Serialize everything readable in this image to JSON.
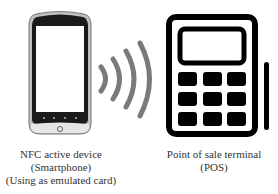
{
  "diagram": {
    "nodes": [
      {
        "id": "phone",
        "type": "smartphone",
        "icon": "smartphone-icon",
        "label_lines": [
          "NFC active device",
          "(Smartphone)",
          "(Using as emulated card)"
        ]
      },
      {
        "id": "waves",
        "type": "signal",
        "icon": "nfc-waves-icon"
      },
      {
        "id": "pos",
        "type": "terminal",
        "icon": "pos-terminal-icon",
        "label_lines": [
          "Point of sale terminal",
          "(POS)"
        ]
      }
    ],
    "colors": {
      "phone_body": "#1a1a1a",
      "phone_bezel": "#d9d9d9",
      "waves": "#7a7a7a",
      "pos": "#000000",
      "text": "#333333"
    }
  }
}
